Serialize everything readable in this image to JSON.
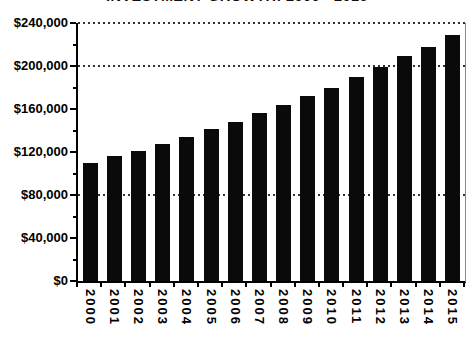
{
  "title": "INVESTMENT GROWTH: 2000 - 2015",
  "colors": {
    "bar": "#0a0a0a",
    "axis": "#000000",
    "grid_dots": "#333333",
    "background": "#ffffff",
    "plot_right_border": "#888888"
  },
  "chart_data": {
    "type": "bar",
    "title": "INVESTMENT GROWTH: 2000 - 2015",
    "categories": [
      "2000",
      "2001",
      "2002",
      "2003",
      "2004",
      "2005",
      "2006",
      "2007",
      "2008",
      "2009",
      "2010",
      "2011",
      "2012",
      "2013",
      "2014",
      "2015"
    ],
    "values": [
      110000,
      116000,
      121000,
      127000,
      134000,
      141000,
      148000,
      156000,
      164000,
      172000,
      180000,
      190000,
      199000,
      209000,
      218000,
      229000
    ],
    "xlabel": "",
    "ylabel": "",
    "ylim": [
      0,
      240000
    ],
    "ytick_step": 40000,
    "ytick_minor_step": 20000,
    "ytick_labels": [
      "$0",
      "$40,000",
      "$80,000",
      "$120,000",
      "$160,000",
      "$200,000",
      "$240,000"
    ],
    "gridlines_at": [
      80000,
      200000,
      240000
    ],
    "grid_style": "dotted",
    "legend_position": "none",
    "bar_color": "#0a0a0a",
    "x_label_rotation_deg": 90
  }
}
